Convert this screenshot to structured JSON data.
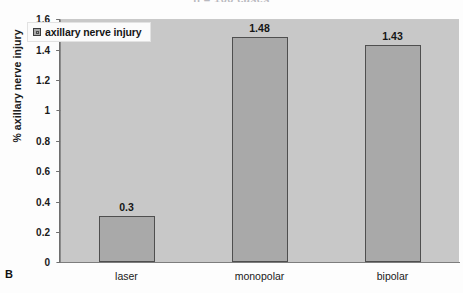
{
  "figure": {
    "panel_letter": "B",
    "cropped_title": "n = 100 cases"
  },
  "legend": {
    "label": "axillary nerve injury",
    "swatch_icon": "square-swatch-icon",
    "position": "top-left inside plot"
  },
  "axes": {
    "y_title": "% axillary nerve injury",
    "y_ticks": [
      "0",
      "0.2",
      "0.4",
      "0.6",
      "0.8",
      "1",
      "1.2",
      "1.4",
      "1.6"
    ]
  },
  "colors": {
    "bar_fill": "#a9a9a9",
    "bar_border": "#4f4f4f",
    "plot_background": "#c8c8c8",
    "axis_line": "#6f6f6f",
    "text": "#151515"
  },
  "chart_data": {
    "type": "bar",
    "title": "n = 100 cases",
    "xlabel": "",
    "ylabel": "% axillary nerve injury",
    "categories": [
      "laser",
      "monopolar",
      "bipolar"
    ],
    "values": [
      0.3,
      1.48,
      1.43
    ],
    "value_labels": [
      "0.3",
      "1.48",
      "1.43"
    ],
    "series": [
      {
        "name": "axillary nerve injury",
        "values": [
          0.3,
          1.48,
          1.43
        ]
      }
    ],
    "ylim": [
      0,
      1.6
    ],
    "ytick_values": [
      0,
      0.2,
      0.4,
      0.6,
      0.8,
      1,
      1.2,
      1.4,
      1.6
    ],
    "grid": false,
    "legend_position": "upper left"
  }
}
